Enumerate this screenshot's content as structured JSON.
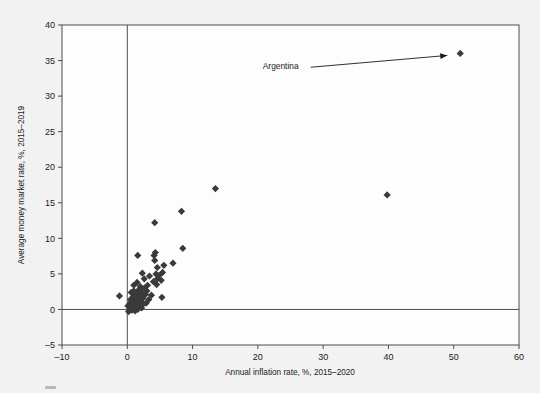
{
  "chart_data": {
    "type": "scatter",
    "title": "",
    "xlabel": "Annual inflation rate, %, 2015–2020",
    "ylabel": "Average money market rate, %, 2015–2019",
    "xlim": [
      -10,
      60
    ],
    "ylim": [
      -5,
      40
    ],
    "xticks": [
      -10,
      0,
      10,
      20,
      30,
      40,
      50,
      60
    ],
    "xtick_labels": [
      "–10",
      "0",
      "10",
      "20",
      "30",
      "40",
      "50",
      "60"
    ],
    "yticks": [
      -5,
      0,
      5,
      10,
      15,
      20,
      25,
      30,
      35,
      40
    ],
    "ytick_labels": [
      "–5",
      "0",
      "5",
      "10",
      "15",
      "20",
      "25",
      "30",
      "35",
      "40"
    ],
    "grid": false,
    "legend": null,
    "marker_shape": "diamond",
    "marker_color": "#3a3a3a",
    "zero_lines": {
      "x": 0,
      "y": 0
    },
    "annotations": [
      {
        "text": "Argentina",
        "text_x": 23.5,
        "text_y": 34.2,
        "point_x": 51.0,
        "point_y": 36.0
      }
    ],
    "points": [
      {
        "x": 51.0,
        "y": 36.0
      },
      {
        "x": 39.8,
        "y": 16.1
      },
      {
        "x": 13.5,
        "y": 17.0
      },
      {
        "x": 8.3,
        "y": 13.8
      },
      {
        "x": 4.2,
        "y": 12.2
      },
      {
        "x": 8.5,
        "y": 8.6
      },
      {
        "x": 1.6,
        "y": 7.6
      },
      {
        "x": 4.3,
        "y": 8.0
      },
      {
        "x": 4.2,
        "y": 6.9
      },
      {
        "x": 7.0,
        "y": 6.5
      },
      {
        "x": 5.6,
        "y": 6.2
      },
      {
        "x": 4.6,
        "y": 5.9
      },
      {
        "x": 5.4,
        "y": 5.2
      },
      {
        "x": 4.4,
        "y": 5.0
      },
      {
        "x": 2.3,
        "y": 5.1
      },
      {
        "x": 3.4,
        "y": 4.7
      },
      {
        "x": 4.6,
        "y": 4.3
      },
      {
        "x": 5.2,
        "y": 4.1
      },
      {
        "x": 4.0,
        "y": 3.9
      },
      {
        "x": 4.5,
        "y": 3.5
      },
      {
        "x": 3.1,
        "y": 3.4
      },
      {
        "x": 1.0,
        "y": 3.4
      },
      {
        "x": 2.0,
        "y": 3.2
      },
      {
        "x": 2.6,
        "y": 3.0
      },
      {
        "x": 1.8,
        "y": 2.8
      },
      {
        "x": 3.0,
        "y": 2.6
      },
      {
        "x": 2.2,
        "y": 2.4
      },
      {
        "x": 1.4,
        "y": 2.3
      },
      {
        "x": 2.8,
        "y": 2.1
      },
      {
        "x": 1.9,
        "y": 2.0
      },
      {
        "x": -1.2,
        "y": 1.9
      },
      {
        "x": 0.9,
        "y": 1.8
      },
      {
        "x": 5.3,
        "y": 1.7
      },
      {
        "x": 2.4,
        "y": 1.6
      },
      {
        "x": 1.6,
        "y": 1.5
      },
      {
        "x": 3.3,
        "y": 1.4
      },
      {
        "x": 2.1,
        "y": 1.2
      },
      {
        "x": 1.2,
        "y": 1.1
      },
      {
        "x": 0.6,
        "y": 1.0
      },
      {
        "x": 1.7,
        "y": 0.9
      },
      {
        "x": 2.5,
        "y": 0.8
      },
      {
        "x": 0.3,
        "y": 0.7
      },
      {
        "x": 1.1,
        "y": 0.6
      },
      {
        "x": 1.9,
        "y": 0.5
      },
      {
        "x": 0.8,
        "y": 0.4
      },
      {
        "x": 1.4,
        "y": 0.3
      },
      {
        "x": 0.4,
        "y": 0.2
      },
      {
        "x": 1.0,
        "y": 0.1
      },
      {
        "x": 1.6,
        "y": 0.0
      },
      {
        "x": 0.7,
        "y": -0.1
      },
      {
        "x": 1.2,
        "y": -0.2
      },
      {
        "x": 0.2,
        "y": -0.3
      },
      {
        "x": 0.9,
        "y": 0.9
      },
      {
        "x": 2.9,
        "y": 0.9
      },
      {
        "x": 1.3,
        "y": 1.9
      },
      {
        "x": 0.5,
        "y": 1.4
      },
      {
        "x": 2.2,
        "y": 0.2
      },
      {
        "x": 0.6,
        "y": 2.4
      },
      {
        "x": 3.7,
        "y": 2.0
      },
      {
        "x": 1.0,
        "y": 2.6
      },
      {
        "x": 2.6,
        "y": 4.3
      },
      {
        "x": 4.9,
        "y": 4.8
      },
      {
        "x": 4.1,
        "y": 7.6
      },
      {
        "x": 0.1,
        "y": 0.5
      },
      {
        "x": 1.5,
        "y": 3.8
      }
    ]
  }
}
